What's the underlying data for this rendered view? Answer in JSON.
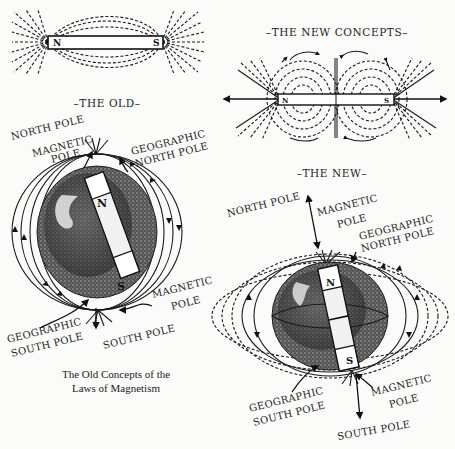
{
  "diagram": {
    "background_color": "#fbfbf9",
    "ink_color": "#1a1a1a",
    "top_left_magnet": {
      "north_label": "N",
      "south_label": "S"
    },
    "new_concepts": {
      "title": "–THE NEW CONCEPTS–",
      "north_label": "N",
      "south_label": "S"
    },
    "old": {
      "title": "–THE OLD–",
      "labels": {
        "north_pole": "NORTH POLE",
        "magnetic_pole_top_1": "MAGNETIC",
        "magnetic_pole_top_2": "POLE",
        "geographic_north_1": "GEOGRAPHIC",
        "geographic_north_2": "NORTH POLE",
        "magnetic_pole_bottom_1": "MAGNETIC",
        "magnetic_pole_bottom_2": "POLE",
        "geographic_south_1": "GEOGRAPHIC",
        "geographic_south_2": "SOUTH POLE",
        "south_pole": "SOUTH POLE"
      },
      "magnet_north": "N",
      "magnet_south": "S",
      "caption_line1": "The Old Concepts of the",
      "caption_line2": "Laws of Magnetism"
    },
    "new": {
      "title": "–THE NEW–",
      "labels": {
        "north_pole": "NORTH POLE",
        "magnetic_pole_top_1": "MAGNETIC",
        "magnetic_pole_top_2": "POLE",
        "geographic_north_1": "GEOGRAPHIC",
        "geographic_north_2": "NORTH POLE",
        "magnetic_pole_bottom_1": "MAGNETIC",
        "magnetic_pole_bottom_2": "POLE",
        "geographic_south_1": "GEOGRAPHIC",
        "geographic_south_2": "SOUTH POLE",
        "south_pole": "SOUTH POLE"
      },
      "magnet_north": "N",
      "magnet_south": "S"
    }
  }
}
